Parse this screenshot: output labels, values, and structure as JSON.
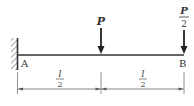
{
  "diagram": {
    "type": "cantilever-beam",
    "support": {
      "label": "A",
      "kind": "fixed-wall"
    },
    "free_end": {
      "label": "B"
    },
    "loads": [
      {
        "name": "midspan-load",
        "label_num": "P",
        "label_den": "",
        "position": "l/2"
      },
      {
        "name": "end-load",
        "label_num": "P",
        "label_den": "2",
        "position": "l"
      }
    ],
    "dimensions": [
      {
        "num": "l",
        "den": "2"
      },
      {
        "num": "l",
        "den": "2"
      }
    ],
    "colors": {
      "line": "#333333",
      "dim": "#666666"
    }
  }
}
